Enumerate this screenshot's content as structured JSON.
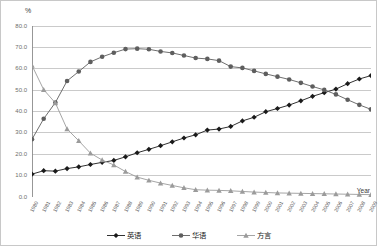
{
  "chart_data": {
    "type": "line",
    "title": "",
    "xlabel": "Year",
    "ylabel": "%",
    "ylim": [
      0,
      80
    ],
    "ytick_step": 10,
    "ytick_labels": [
      "0.0",
      "10.0",
      "20.0",
      "30.0",
      "40.0",
      "50.0",
      "60.0",
      "70.0",
      "80.0"
    ],
    "grid": true,
    "legend_position": "bottom",
    "categories": [
      "1980",
      "1981",
      "1982",
      "1983",
      "1984",
      "1985",
      "1986",
      "1987",
      "1988",
      "1989",
      "1990",
      "1991",
      "1992",
      "1993",
      "1994",
      "1995",
      "1996",
      "1997",
      "1998",
      "1999",
      "2000",
      "2001",
      "2002",
      "2003",
      "2004",
      "2005",
      "2006",
      "2007",
      "2008",
      "2009"
    ],
    "series": [
      {
        "name": "英语",
        "marker": "diamond",
        "color": "#1a1a1a",
        "values": [
          10.7,
          12.3,
          12.1,
          13.3,
          14.1,
          15.2,
          16.2,
          17.1,
          18.8,
          20.7,
          22.3,
          24.0,
          25.8,
          27.6,
          29.1,
          31.3,
          31.8,
          33.0,
          35.6,
          37.3,
          39.9,
          41.4,
          43.0,
          45.0,
          47.1,
          48.8,
          50.5,
          53.0,
          55.2,
          56.8
        ]
      },
      {
        "name": "华语",
        "marker": "circle",
        "color": "#5e5e5e",
        "values": [
          27.0,
          36.6,
          44.2,
          54.3,
          58.7,
          63.2,
          65.6,
          67.5,
          69.2,
          69.4,
          69.1,
          68.1,
          67.4,
          66.2,
          65.0,
          64.6,
          63.8,
          61.0,
          60.4,
          59.0,
          57.6,
          56.3,
          55.0,
          53.4,
          51.7,
          50.1,
          48.0,
          45.5,
          43.1,
          41.0
        ]
      },
      {
        "name": "方言",
        "marker": "triangle",
        "color": "#9b9b9b",
        "values": [
          61.5,
          50.2,
          44.0,
          31.8,
          26.3,
          20.5,
          17.3,
          15.0,
          11.9,
          9.3,
          7.8,
          6.5,
          5.4,
          4.3,
          3.4,
          3.2,
          3.1,
          2.9,
          2.6,
          2.3,
          2.1,
          1.9,
          1.8,
          1.7,
          1.6,
          1.5,
          1.4,
          1.3,
          1.2,
          1.1
        ]
      }
    ]
  },
  "legend": {
    "items": [
      {
        "label": "英语"
      },
      {
        "label": "华语"
      },
      {
        "label": "方言"
      }
    ]
  },
  "axes": {
    "y_unit": "%",
    "x_title": "Year"
  }
}
